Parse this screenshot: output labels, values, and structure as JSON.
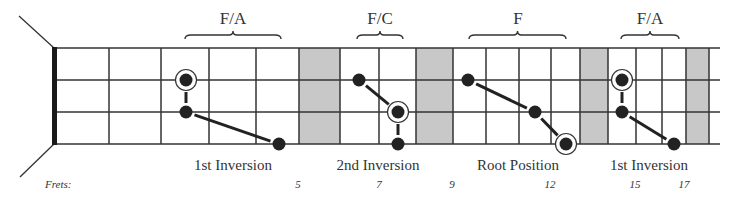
{
  "diagram": {
    "frets_caption": "Frets:",
    "colors": {
      "line": "#333333",
      "dot": "#222222",
      "marker_fill": "#c8c8c8",
      "background": "#ffffff"
    },
    "geometry": {
      "nut_x": 54,
      "end_x": 720,
      "string_y": [
        48,
        80,
        112,
        144
      ],
      "fret_x": [
        109,
        161,
        209,
        256,
        299,
        340,
        379,
        416,
        453,
        486,
        519,
        551,
        580,
        608,
        636,
        662,
        686,
        709
      ],
      "shaded_cells": [
        [
          299,
          340
        ],
        [
          416,
          453
        ],
        [
          580,
          608
        ],
        [
          686,
          709
        ]
      ]
    },
    "chords": [
      {
        "name": "F/A",
        "position": "1st Inversion",
        "brace": [
          185,
          281
        ],
        "label_x": 233,
        "position_x": 233,
        "dots": [
          {
            "x": 186,
            "y": 80,
            "root": true
          },
          {
            "x": 186,
            "y": 112,
            "root": false
          },
          {
            "x": 279,
            "y": 144,
            "root": false
          }
        ]
      },
      {
        "name": "F/C",
        "position": "2nd Inversion",
        "brace": [
          357,
          403
        ],
        "label_x": 380,
        "position_x": 378,
        "dots": [
          {
            "x": 359,
            "y": 80,
            "root": false
          },
          {
            "x": 398,
            "y": 112,
            "root": true
          },
          {
            "x": 398,
            "y": 144,
            "root": false
          }
        ]
      },
      {
        "name": "F",
        "position": "Root Position",
        "brace": [
          469,
          566
        ],
        "label_x": 518,
        "position_x": 518,
        "dots": [
          {
            "x": 468,
            "y": 80,
            "root": false
          },
          {
            "x": 535,
            "y": 112,
            "root": false
          },
          {
            "x": 566,
            "y": 144,
            "root": true
          }
        ]
      },
      {
        "name": "F/A",
        "position": "1st Inversion",
        "brace": [
          621,
          679
        ],
        "label_x": 650,
        "position_x": 649,
        "dots": [
          {
            "x": 622,
            "y": 80,
            "root": true
          },
          {
            "x": 622,
            "y": 112,
            "root": false
          },
          {
            "x": 674,
            "y": 144,
            "root": false
          }
        ]
      }
    ],
    "fret_numbers": [
      {
        "label": "5",
        "x": 298
      },
      {
        "label": "7",
        "x": 379
      },
      {
        "label": "9",
        "x": 452
      },
      {
        "label": "12",
        "x": 550
      },
      {
        "label": "15",
        "x": 635
      },
      {
        "label": "17",
        "x": 684
      }
    ]
  }
}
